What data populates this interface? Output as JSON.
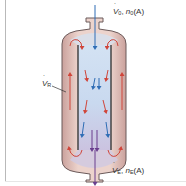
{
  "diagram": {
    "type": "loop reactor (draft-tube recirculation)",
    "labels": {
      "inlet": {
        "symbol": "V",
        "sub": "0",
        "sep": ", ",
        "n": "n",
        "n_sub": "0",
        "species": "(A)"
      },
      "outlet": {
        "symbol": "V",
        "sub": "E",
        "sep": ", ",
        "n": "n",
        "n_sub": "E",
        "species": "(A)"
      },
      "recycle": {
        "symbol": "V",
        "sub": "R"
      }
    },
    "colors": {
      "vessel_fill": "#e3c4bd",
      "core_fill": "#cfdcee",
      "wall": "#5b4b4b",
      "draft_tube": "#3a3a3a",
      "inlet_arrow": "#2f6db5",
      "outer_arrow": "#d0453a",
      "outlet_arrow": "#6a3f8e"
    }
  }
}
